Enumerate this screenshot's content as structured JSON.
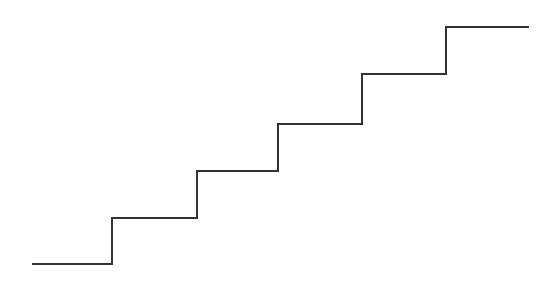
{
  "diagram": {
    "type": "staircase-line",
    "stroke_color": "#333333",
    "stroke_width": 2,
    "background": "#ffffff",
    "points": [
      [
        32,
        264
      ],
      [
        112,
        264
      ],
      [
        112,
        218
      ],
      [
        197,
        218
      ],
      [
        197,
        171
      ],
      [
        278,
        171
      ],
      [
        278,
        124
      ],
      [
        362,
        124
      ],
      [
        362,
        74
      ],
      [
        446,
        74
      ],
      [
        446,
        27
      ],
      [
        529,
        27
      ]
    ],
    "steps": [
      {
        "index": 1,
        "y": 264,
        "x_start": 32,
        "x_end": 112
      },
      {
        "index": 2,
        "y": 218,
        "x_start": 112,
        "x_end": 197
      },
      {
        "index": 3,
        "y": 171,
        "x_start": 197,
        "x_end": 278
      },
      {
        "index": 4,
        "y": 124,
        "x_start": 278,
        "x_end": 362
      },
      {
        "index": 5,
        "y": 74,
        "x_start": 362,
        "x_end": 446
      },
      {
        "index": 6,
        "y": 27,
        "x_start": 446,
        "x_end": 529
      }
    ]
  }
}
